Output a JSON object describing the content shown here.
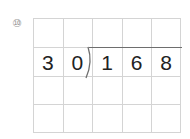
{
  "problem": {
    "number_label": "⑩",
    "divisor": [
      "3",
      "0"
    ],
    "dividend": [
      "1",
      "6",
      "8"
    ]
  },
  "grid": {
    "columns": 5,
    "rows": 4,
    "line_color": "#d4d4d4",
    "bracket_color": "#6e6e6e",
    "digit_color": "#222222"
  }
}
